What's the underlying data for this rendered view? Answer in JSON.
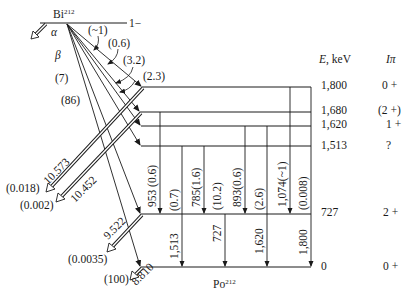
{
  "parent": {
    "name": "Bi",
    "mass": "212",
    "spin_parity": "1−"
  },
  "daughter": {
    "name": "Po",
    "mass": "212"
  },
  "labels": {
    "alpha": "α",
    "beta": "β",
    "energy_header": "E, keV",
    "spin_header": "Iπ"
  },
  "levels": [
    {
      "energy": "1,800",
      "spin": "0 +"
    },
    {
      "energy": "1,680",
      "spin": "(2 +)"
    },
    {
      "energy": "1,620",
      "spin": "1 +"
    },
    {
      "energy": "1,513",
      "spin": "?"
    },
    {
      "energy": "727",
      "spin": "2 +"
    },
    {
      "energy": "0",
      "spin": "0 +"
    }
  ],
  "beta_branches": [
    {
      "to": "1,800",
      "intensity": "(~1)"
    },
    {
      "to": "1,680",
      "intensity": "(0.6)"
    },
    {
      "to": "1,620",
      "intensity": "(3.2)"
    },
    {
      "to": "1,513",
      "intensity": "(2.3)"
    },
    {
      "to": "727",
      "intensity": "(7)"
    },
    {
      "to": "0",
      "intensity": "(86)"
    }
  ],
  "gamma_transitions": [
    {
      "from": "1,680",
      "to": "727",
      "energy": "953",
      "intensity": "(0.6)",
      "label": "953 (0.6)"
    },
    {
      "from": "1,513",
      "to": "0",
      "energy": "1,513",
      "intensity": "(0.7)"
    },
    {
      "from": "1,513",
      "to": "727",
      "energy": "785",
      "intensity": "(1.6)",
      "label": "785(1.6)"
    },
    {
      "from": "727",
      "to": "0",
      "energy": "727",
      "intensity": "(10.2)"
    },
    {
      "from": "1,620",
      "to": "727",
      "energy": "893",
      "intensity": "(0.6)",
      "label": "893(0.6)"
    },
    {
      "from": "1,620",
      "to": "0",
      "energy": "1,620",
      "intensity": "(2.6)"
    },
    {
      "from": "1,800",
      "to": "727",
      "energy": "1,074",
      "intensity": "(~1)",
      "label": "1,074(~1)"
    },
    {
      "from": "1,800",
      "to": "0",
      "energy": "1,800",
      "intensity": "(0.008)"
    }
  ],
  "alpha_transitions": [
    {
      "from": "1,800",
      "energy": "10.573",
      "intensity": "(0.018)"
    },
    {
      "from": "1,680",
      "energy": "10.452",
      "intensity": "(0.002)"
    },
    {
      "from": "727",
      "energy": "9.522",
      "intensity": "(0.0035)"
    },
    {
      "from": "0",
      "energy": "8.810",
      "intensity": "(100)"
    }
  ]
}
